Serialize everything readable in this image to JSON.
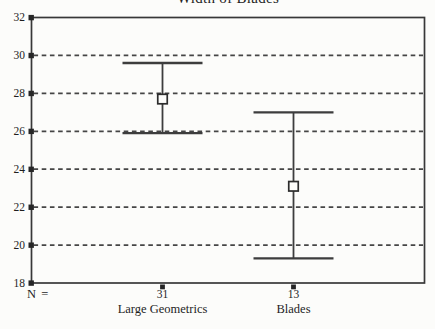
{
  "title": "Width of Blades",
  "axis": {
    "n_label": "N ="
  },
  "colors": {
    "background": "#fcfcfa",
    "frame": "#383838",
    "grid": "#454545",
    "bar": "#3d3d3d",
    "tick": "#262626",
    "text": "#1e1e1e",
    "marker_fill": "#fcfcfa",
    "marker_stroke": "#2c2c2c"
  },
  "chart_data": {
    "type": "error-bar",
    "title": "Width of Blades",
    "categories": [
      "Large Geometrics",
      "Blades"
    ],
    "n_values": [
      31,
      13
    ],
    "series": [
      {
        "name": "95% CI",
        "means": [
          27.7,
          23.1
        ],
        "upper": [
          29.6,
          27.0
        ],
        "lower": [
          25.9,
          19.3
        ]
      }
    ],
    "marker": "open-square",
    "ylim": [
      18,
      32
    ],
    "yticks": [
      32,
      30,
      28,
      26,
      24,
      22,
      20,
      18
    ],
    "grid_values": [
      30,
      28,
      26,
      24,
      22,
      20
    ],
    "grid_style": "dashed-horizontal",
    "xlabel": "",
    "ylabel": ""
  }
}
